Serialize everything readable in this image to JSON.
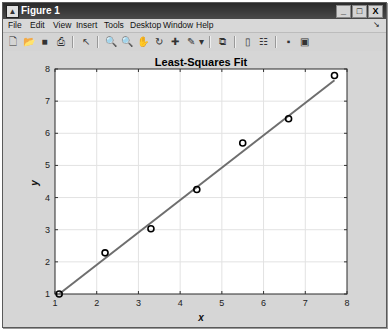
{
  "window": {
    "title": "Figure 1",
    "controls": {
      "minimize": "_",
      "maximize": "□",
      "close": "X"
    }
  },
  "menubar": {
    "items": [
      {
        "label": "File"
      },
      {
        "label": "Edit"
      },
      {
        "label": "View"
      },
      {
        "label": "Insert"
      },
      {
        "label": "Tools"
      },
      {
        "label": "Desktop"
      },
      {
        "label": "Window"
      },
      {
        "label": "Help"
      }
    ],
    "dock_glyph": "↘"
  },
  "toolbar": {
    "buttons": [
      {
        "name": "new-figure-icon",
        "glyph": "🗋"
      },
      {
        "name": "open-file-icon",
        "glyph": "📂"
      },
      {
        "name": "save-icon",
        "glyph": "■"
      },
      {
        "name": "print-icon",
        "glyph": "⎙"
      },
      {
        "name": "edit-plot-arrow-icon",
        "glyph": "↖"
      },
      {
        "name": "zoom-in-icon",
        "glyph": "🔍"
      },
      {
        "name": "zoom-out-icon",
        "glyph": "🔍"
      },
      {
        "name": "pan-hand-icon",
        "glyph": "✋"
      },
      {
        "name": "rotate-3d-icon",
        "glyph": "↻"
      },
      {
        "name": "data-cursor-icon",
        "glyph": "✚"
      },
      {
        "name": "brush-icon",
        "glyph": "✎"
      },
      {
        "name": "brush-dropdown-icon",
        "glyph": "▾"
      },
      {
        "name": "link-plot-icon",
        "glyph": "⧉"
      },
      {
        "name": "insert-colorbar-icon",
        "glyph": "▯"
      },
      {
        "name": "insert-legend-icon",
        "glyph": "☷"
      },
      {
        "name": "hide-plot-tools-icon",
        "glyph": "▪"
      },
      {
        "name": "show-plot-tools-icon",
        "glyph": "▣"
      }
    ]
  },
  "colors": {
    "line": "#6e6e6e",
    "marker": "#000000",
    "grid": "#e2e2e2",
    "axes_bg": "#ffffff",
    "figure_bg": "#d6d6d6"
  },
  "chart_data": {
    "type": "line",
    "title": "Least-Squares Fit",
    "xlabel": "x",
    "ylabel": "y",
    "xlim": [
      1,
      8
    ],
    "ylim": [
      1,
      8
    ],
    "xticks": [
      1,
      2,
      3,
      4,
      5,
      6,
      7,
      8
    ],
    "yticks": [
      1,
      2,
      3,
      4,
      5,
      6,
      7,
      8
    ],
    "grid": true,
    "series": [
      {
        "name": "data",
        "style": "markers",
        "marker": "circle",
        "x": [
          1.1,
          2.2,
          3.3,
          4.4,
          5.5,
          6.6,
          7.7
        ],
        "y": [
          1.0,
          2.28,
          3.03,
          4.25,
          5.7,
          6.45,
          7.8
        ]
      },
      {
        "name": "least-squares fit",
        "style": "line",
        "x": [
          1.1,
          7.7
        ],
        "y": [
          1.0,
          7.65
        ]
      }
    ]
  }
}
